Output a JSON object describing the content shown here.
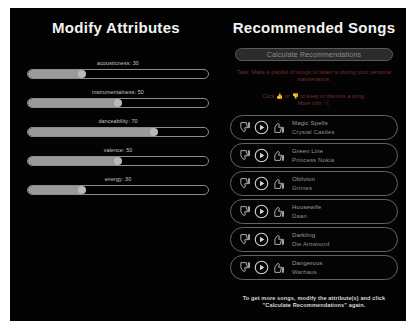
{
  "left": {
    "title": "Modify Attributes",
    "sliders": [
      {
        "name": "acousticness",
        "label": "acousticness: 30",
        "value": 30,
        "min": 0,
        "max": 100
      },
      {
        "name": "instrumentalness",
        "label": "instrumentalness: 50",
        "value": 50,
        "min": 0,
        "max": 100
      },
      {
        "name": "danceability",
        "label": "danceability: 70",
        "value": 70,
        "min": 0,
        "max": 100
      },
      {
        "name": "valence",
        "label": "valence: 50",
        "value": 50,
        "min": 0,
        "max": 100
      },
      {
        "name": "energy",
        "label": "energy: 30",
        "value": 30,
        "min": 0,
        "max": 100
      }
    ]
  },
  "right": {
    "title": "Recommended Songs",
    "calculate_button": "Calculate Recommendations",
    "task_text": "Task: Make a playlist of songs to listen to during your personal maintenance.",
    "click_text_before": "Click",
    "click_text_middle": "or",
    "click_text_after": "to keep or dismiss a song.",
    "more_info_label": "More info:",
    "thumb_up_icon": "thumbs-up-icon",
    "thumb_down_icon": "thumbs-down-icon",
    "info_icon": "info-icon",
    "songs": [
      {
        "title": "Magic Spells",
        "artist": "Crystal Castles"
      },
      {
        "title": "Green Line",
        "artist": "Princess Nokia"
      },
      {
        "title": "Oblivion",
        "artist": "Grimes"
      },
      {
        "title": "Housewife",
        "artist": "Daan"
      },
      {
        "title": "Darkling",
        "artist": "Die Antwoord"
      },
      {
        "title": "Dangerous",
        "artist": "Warhaus"
      }
    ],
    "footer_note": "To get more songs, modify the attribute(s) and click \"Calculate Recommendations\" again."
  },
  "colors": {
    "background": "#030303",
    "text_primary": "#f2f2f2",
    "text_secondary": "#9b9b9b",
    "task_red": "#7b2f2f",
    "border": "#636363",
    "slider_fill": "#9a9a9a"
  }
}
